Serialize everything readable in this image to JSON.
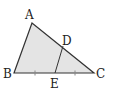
{
  "diagram": {
    "type": "triangle",
    "fill": "#e4e4e4",
    "stroke": "#333333",
    "points": {
      "A": {
        "label": "A",
        "x": 32,
        "y": 23
      },
      "B": {
        "label": "B",
        "x": 14,
        "y": 73
      },
      "C": {
        "label": "C",
        "x": 94,
        "y": 73
      },
      "D": {
        "label": "D",
        "x": 63,
        "y": 46
      },
      "E": {
        "label": "E",
        "x": 55,
        "y": 73
      }
    },
    "segments": [
      "AB",
      "AC",
      "BC",
      "DE"
    ],
    "tick_marks": [
      "BE",
      "EC"
    ]
  }
}
